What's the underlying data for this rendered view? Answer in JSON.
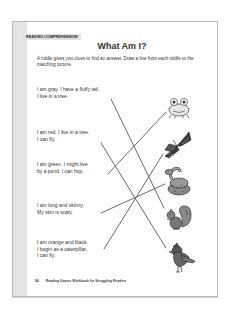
{
  "section_tag": "Reading Comprehension",
  "title": "What Am I?",
  "instructions": "A riddle gives you clues to find an answer. Draw a line from each riddle to the matching picture.",
  "riddles": [
    {
      "lines": [
        "I am gray. I have a fluffy tail.",
        "I live in a tree."
      ],
      "answer": "squirrel"
    },
    {
      "lines": [
        "I am red. I live in a tree.",
        "I can fly."
      ],
      "answer": "cardinal"
    },
    {
      "lines": [
        "I am green. I might live",
        "by a pond. I can hop."
      ],
      "answer": "frog"
    },
    {
      "lines": [
        "I am long and skinny.",
        "My skin is scaly."
      ],
      "answer": "snake"
    },
    {
      "lines": [
        "I am orange and black.",
        "I begin as a caterpillar.",
        "I can fly."
      ],
      "answer": "butterfly"
    }
  ],
  "pictures": [
    "frog-icon",
    "butterfly-icon",
    "snake-icon",
    "squirrel-icon",
    "cardinal-icon"
  ],
  "footer": {
    "page_number": "86",
    "book_title": "Reading Games Workbook for Struggling Readers"
  },
  "colors": {
    "line": "#6a6a6a",
    "strip": "#e4e4e4",
    "border": "#b8b8b8"
  }
}
